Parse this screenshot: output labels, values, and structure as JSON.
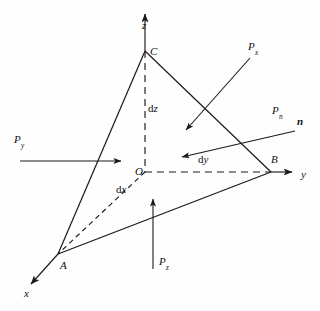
{
  "figure": {
    "type": "3d-tetrahedron-stress-diagram",
    "background_color": "#fefefe",
    "line_color": "#1a1a1a"
  },
  "axes": [
    {
      "name": "z-axis",
      "label": "z",
      "x": 142,
      "y": 25,
      "direction": "up"
    },
    {
      "name": "y-axis",
      "label": "y",
      "x": 301,
      "y": 176,
      "direction": "right"
    },
    {
      "name": "x-axis",
      "label": "x",
      "x": 24,
      "y": 296,
      "direction": "down-left"
    }
  ],
  "vertices": [
    {
      "name": "origin",
      "label": "O",
      "x": 135,
      "y": 174,
      "px": 145,
      "py": 172
    },
    {
      "name": "vertex-c",
      "label": "C",
      "x": 150,
      "y": 54,
      "px": 145,
      "py": 51
    },
    {
      "name": "vertex-b",
      "label": "B",
      "x": 272,
      "y": 162,
      "px": 271,
      "py": 172
    },
    {
      "name": "vertex-a",
      "label": "A",
      "x": 60,
      "y": 268,
      "px": 58,
      "py": 254
    }
  ],
  "dimensions": [
    {
      "name": "dz",
      "prefix": "d",
      "symbol": "z",
      "x": 148,
      "y": 109
    },
    {
      "name": "dy",
      "prefix": "d",
      "symbol": "y",
      "x": 198,
      "y": 160
    },
    {
      "name": "dx",
      "prefix": "d",
      "symbol": "x",
      "x": 116,
      "y": 190
    }
  ],
  "forces": [
    {
      "name": "force-px",
      "base": "P",
      "subscript": "x",
      "label_x": 248,
      "label_y": 47,
      "arrow": {
        "x1": 250,
        "y1": 58,
        "x2": 186,
        "y2": 130
      }
    },
    {
      "name": "force-pn",
      "base": "P",
      "subscript": "n",
      "label_x": 272,
      "label_y": 111,
      "arrow": {
        "x1": 295,
        "y1": 131,
        "x2": 182,
        "y2": 157
      }
    },
    {
      "name": "force-py",
      "base": "P",
      "subscript": "y",
      "label_x": 14,
      "label_y": 140,
      "arrow": {
        "x1": 20,
        "y1": 161,
        "x2": 121,
        "y2": 161
      }
    },
    {
      "name": "force-pz",
      "base": "P",
      "subscript": "z",
      "label_x": 159,
      "label_y": 262,
      "arrow": {
        "x1": 153,
        "y1": 269,
        "x2": 153,
        "y2": 199
      }
    }
  ],
  "normal_vector": {
    "name": "normal-n",
    "label": "n",
    "x": 297,
    "y": 122,
    "bold": true
  },
  "edges": [
    {
      "name": "edge-c-a",
      "style": "solid",
      "x1": 145,
      "y1": 51,
      "x2": 58,
      "y2": 254
    },
    {
      "name": "edge-c-b",
      "style": "solid",
      "x1": 145,
      "y1": 51,
      "x2": 271,
      "y2": 172
    },
    {
      "name": "edge-a-b",
      "style": "solid",
      "x1": 58,
      "y1": 254,
      "x2": 271,
      "y2": 172
    },
    {
      "name": "edge-o-c",
      "style": "dashed",
      "x1": 145,
      "y1": 51,
      "x2": 145,
      "y2": 172
    },
    {
      "name": "edge-o-b",
      "style": "dashed",
      "x1": 145,
      "y1": 172,
      "x2": 271,
      "y2": 172
    },
    {
      "name": "edge-o-a",
      "style": "dashed",
      "x1": 145,
      "y1": 172,
      "x2": 58,
      "y2": 254
    }
  ]
}
